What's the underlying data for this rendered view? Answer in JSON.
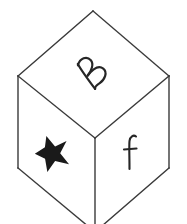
{
  "figure": {
    "background_color": "#ffffff",
    "edge_color": "#3a3a3a",
    "edge_width": 1.4,
    "face_fill": "#ffffff",
    "mark_color": "#111111",
    "width": 187,
    "height": 224,
    "cropped_bottom": true
  },
  "cube": {
    "vertices": {
      "top": [
        93,
        11
      ],
      "left_upper": [
        18,
        76
      ],
      "right_upper": [
        169,
        76
      ],
      "center": [
        95,
        138
      ],
      "left_lower": [
        18,
        168
      ],
      "right_lower": [
        169,
        168
      ],
      "bottom": [
        95,
        232
      ]
    },
    "faces": [
      {
        "id": "top-face",
        "name": "top-face",
        "label": "B",
        "label_kind": "letter",
        "polygon": "93,11 18,76 95,138 169,76"
      },
      {
        "id": "left-face",
        "name": "left-face",
        "label": "star",
        "label_kind": "symbol",
        "polygon": "18,76 18,168 95,232 95,138"
      },
      {
        "id": "right-face",
        "name": "right-face",
        "label": "F",
        "label_kind": "letter",
        "polygon": "95,138 95,232 169,168 169,76"
      }
    ]
  },
  "marks": {
    "top_letter": {
      "character": "B",
      "face": "top-face",
      "center": [
        91,
        73
      ],
      "rotation_deg": -52,
      "font_size": 30,
      "style": "handwritten-italic"
    },
    "left_symbol": {
      "character": "★",
      "name": "star",
      "face": "left-face",
      "center": [
        52,
        152
      ],
      "rotation_deg": -18,
      "size": 30,
      "fill": "#111111"
    },
    "right_letter": {
      "character": "F",
      "face": "right-face",
      "center": [
        131,
        152
      ],
      "rotation_deg": 0,
      "font_size": 27,
      "style": "handwritten"
    }
  }
}
